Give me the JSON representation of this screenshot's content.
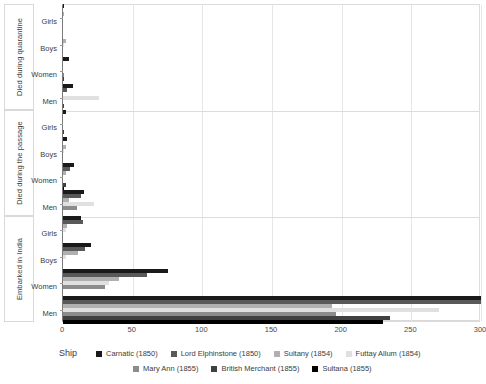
{
  "chart_data": {
    "type": "bar",
    "orientation": "horizontal",
    "grouped": true,
    "title": "",
    "xlabel": "",
    "ylabel": "",
    "xlim": [
      0,
      300
    ],
    "xticks": [
      0,
      50,
      100,
      150,
      200,
      250,
      300
    ],
    "grid": true,
    "legend_title": "Ship",
    "legend_position": "bottom",
    "series": [
      {
        "name": "Carnatic (1850)",
        "color": "#1a1a1a"
      },
      {
        "name": "Lord Elphinstone (1850)",
        "color": "#595959"
      },
      {
        "name": "Sultany (1854)",
        "color": "#b0b0b0"
      },
      {
        "name": "Futtay Allum (1854)",
        "color": "#e0e0e0"
      },
      {
        "name": "Mary Ann (1855)",
        "color": "#8c8c8c"
      },
      {
        "name": "British Merchant (1855)",
        "color": "#404040"
      },
      {
        "name": "Sultana (1855)",
        "color": "#000000"
      }
    ],
    "groups": [
      {
        "label": "Died during quarantine",
        "categories": [
          "Girls",
          "Boys",
          "Women",
          "Men"
        ],
        "values": {
          "Girls": [
            1,
            0,
            1,
            0,
            0,
            0,
            0
          ],
          "Boys": [
            0,
            0,
            2,
            1,
            0,
            0,
            0
          ],
          "Women": [
            4,
            0,
            0,
            0,
            1,
            1,
            0
          ],
          "Men": [
            7,
            3,
            0,
            26,
            0,
            1,
            0
          ]
        }
      },
      {
        "label": "Died during the passage",
        "categories": [
          "Girls",
          "Boys",
          "Women",
          "Men"
        ],
        "values": {
          "Girls": [
            2,
            0,
            0,
            0,
            0,
            1,
            0
          ],
          "Boys": [
            3,
            0,
            2,
            1,
            0,
            0,
            0
          ],
          "Women": [
            8,
            5,
            2,
            0,
            0,
            2,
            1
          ],
          "Men": [
            15,
            13,
            4,
            22,
            10,
            0,
            0
          ]
        }
      },
      {
        "label": "Embarked in India",
        "categories": [
          "Girls",
          "Boys",
          "Women",
          "Men"
        ],
        "values": {
          "Girls": [
            13,
            14,
            3,
            2,
            0,
            0,
            0
          ],
          "Boys": [
            20,
            16,
            11,
            2,
            0,
            0,
            0
          ],
          "Women": [
            75,
            60,
            40,
            33,
            30,
            0,
            0
          ],
          "Men": [
            300,
            300,
            193,
            270,
            196,
            235,
            230
          ]
        }
      }
    ]
  }
}
